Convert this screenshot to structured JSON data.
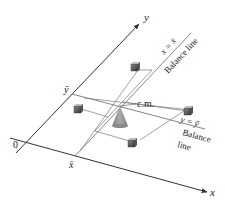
{
  "diagram": {
    "axes": {
      "x_label": "x",
      "y_label": "y",
      "origin_label": "0"
    },
    "tick_labels": {
      "x_bar": "x̄",
      "y_bar": "ȳ"
    },
    "balance_lines": [
      {
        "equation": "x = x̄",
        "caption": "Balance line"
      },
      {
        "equation": "y = ȳ",
        "caption_line1": "Balance",
        "caption_line2": "line"
      }
    ],
    "center_of_mass_label": "c.m.",
    "masses_count": 4,
    "colors": {
      "line": "#555555",
      "axis": "#333333",
      "cone": "#9a9a9a",
      "mass": "#555555"
    }
  }
}
